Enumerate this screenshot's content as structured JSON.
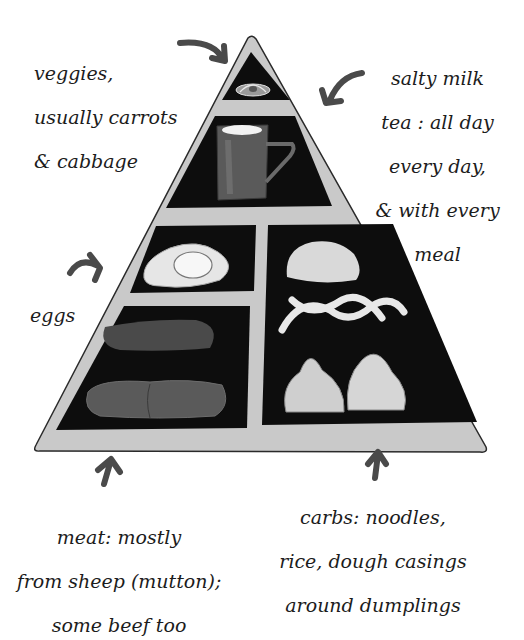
{
  "illustration": {
    "subject": "food pyramid",
    "style": "hand-drawn ink and gray wash",
    "colors": {
      "background": "#ffffff",
      "pyramid_frame": "#c9c9c9",
      "cell_fill": "#0d0d0d",
      "outline": "#2a2a2a",
      "arrow": "#4a4a4a",
      "food_light": "#e8e8e8",
      "food_dark": "#555555"
    },
    "tiers": [
      {
        "level": 1,
        "name": "veggies",
        "food_icon": "cabbage-carrot-icon"
      },
      {
        "level": 2,
        "name": "salty milk tea",
        "food_icon": "mug-icon"
      },
      {
        "level": 3,
        "name": "eggs",
        "food_icon": "fried-egg-icon"
      },
      {
        "level": 4,
        "name": "meat",
        "food_icon": "meat-slab-icon"
      },
      {
        "level": 4,
        "name": "carbs",
        "food_icon": "dumpling-noodle-icon"
      }
    ]
  },
  "labels": {
    "veggies": [
      "veggies,",
      "usually carrots",
      "& cabbage"
    ],
    "tea": [
      "salty milk",
      "tea : all day",
      "every day,",
      "& with every",
      "meal"
    ],
    "eggs": [
      "eggs"
    ],
    "meat": [
      "meat: mostly",
      "from sheep (mutton);",
      "some beef too"
    ],
    "carbs": [
      "carbs: noodles,",
      "rice, dough casings",
      "around dumplings"
    ]
  }
}
